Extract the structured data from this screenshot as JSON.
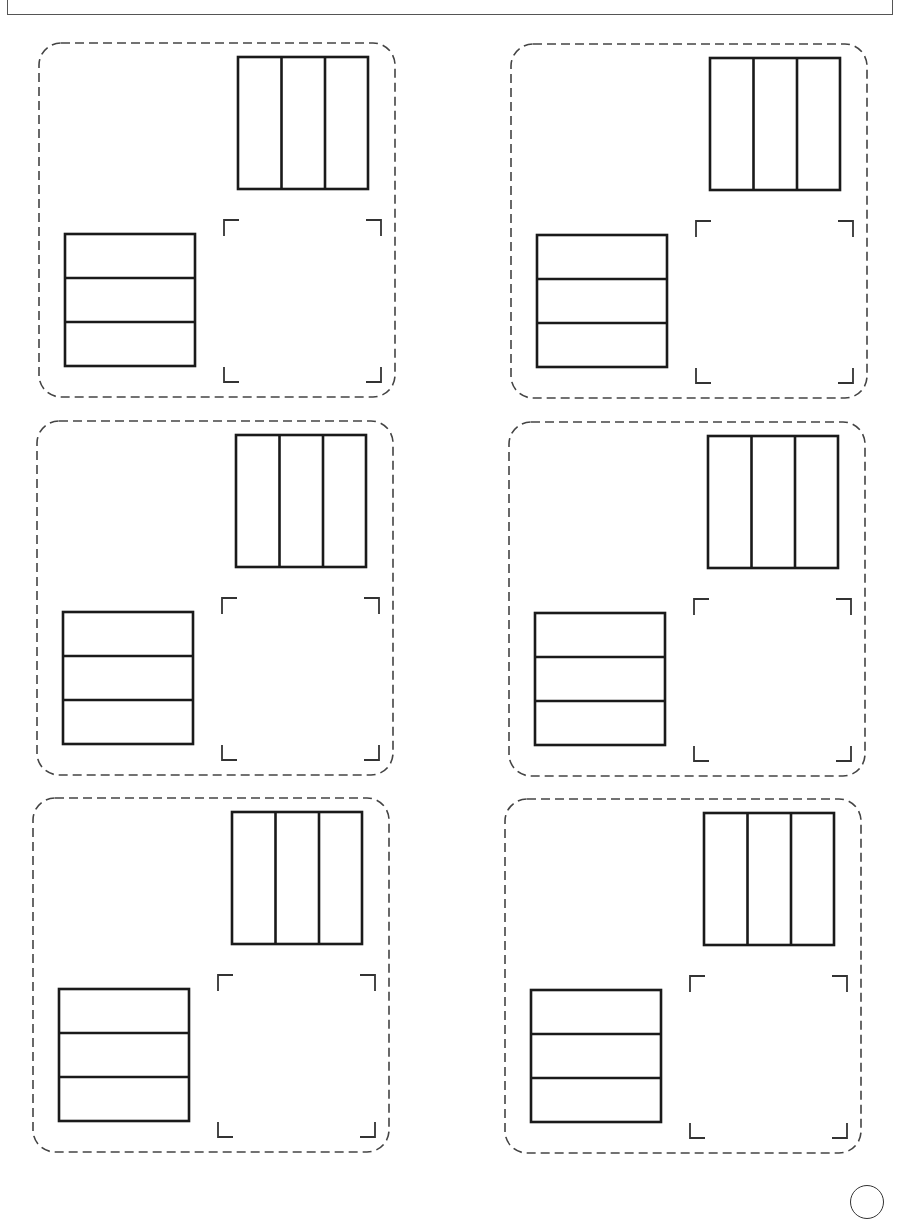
{
  "worksheet": {
    "header": {
      "text": ""
    },
    "card_count": 6,
    "cards": [
      {
        "id": 1,
        "position": "row-1-left",
        "left": 38,
        "top": 42
      },
      {
        "id": 2,
        "position": "row-1-right",
        "left": 510,
        "top": 43
      },
      {
        "id": 3,
        "position": "row-2-left",
        "left": 36,
        "top": 420
      },
      {
        "id": 4,
        "position": "row-2-right",
        "left": 508,
        "top": 421
      },
      {
        "id": 5,
        "position": "row-3-left",
        "left": 32,
        "top": 797
      },
      {
        "id": 6,
        "position": "row-3-right",
        "left": 504,
        "top": 798
      }
    ],
    "card_contents": {
      "vertical_model": {
        "label": "3 vertical parts",
        "parts": 3,
        "orientation": "columns"
      },
      "horizontal_model": {
        "label": "3 horizontal parts",
        "parts": 3,
        "orientation": "rows"
      },
      "answer_box": {
        "label": "empty answer area with corner brackets"
      }
    },
    "colors": {
      "stroke": "#1a1a1a",
      "dashed_border": "#444444",
      "background": "#ffffff"
    },
    "page_badge": {
      "text": ""
    }
  }
}
